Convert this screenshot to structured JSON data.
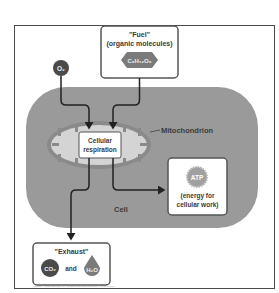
{
  "diagram": {
    "type": "cellular-respiration-flow",
    "fuel": {
      "title": "\"Fuel\"",
      "subtitle": "(organic molecules)",
      "molecule": "C₆H₁₂O₆"
    },
    "oxygen": {
      "label": "O₂"
    },
    "cell": {
      "label": "Cell"
    },
    "mitochondrion": {
      "label": "Mitochondrion"
    },
    "process": {
      "line1": "Cellular",
      "line2": "respiration"
    },
    "atp": {
      "label": "ATP",
      "line1": "(energy for",
      "line2": "cellular work)"
    },
    "exhaust": {
      "title": "\"Exhaust\"",
      "co2": "CO₂",
      "and": "and",
      "h2o": "H₂O"
    },
    "caption": "Copyright © Pearson Education, Inc., publishing as Benjamin Cummings. All rights reserved.",
    "colors": {
      "cell_fill": "#9a9a9a",
      "mito_fill": "#d4d4d4",
      "mito_outline": "#8a8a8a",
      "dark_circle": "#4a4a4a",
      "arrow": "#222222",
      "box_border": "#555555"
    }
  }
}
